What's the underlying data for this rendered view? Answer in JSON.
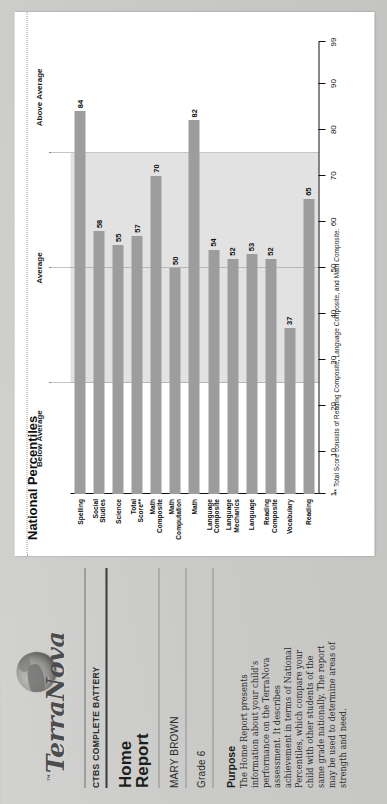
{
  "document": {
    "brand": "TerraNova",
    "brand_tm": "™",
    "battery": "CTBS COMPLETE BATTERY",
    "report_title_line1": "Home",
    "report_title_line2": "Report",
    "student_name": "MARY BROWN",
    "grade": "Grade 6",
    "purpose_heading": "Purpose",
    "purpose_body": "The Home Report presents information about your child's performance on the TerraNova assessment. It describes achievement in terms of National Percentiles, which compare your child with other students of the same grade nationally. The report may be used to determine areas of strength and need."
  },
  "chart_data": {
    "type": "bar",
    "title": "National Percentiles",
    "orientation": "vertical",
    "xlabel": "",
    "ylabel": "",
    "ylim": [
      1,
      99
    ],
    "grid": false,
    "tick_labels": [
      "99",
      "90",
      "80",
      "70",
      "60",
      "50",
      "40",
      "30",
      "20",
      "10",
      "1"
    ],
    "tick_values": [
      99,
      90,
      80,
      70,
      60,
      50,
      40,
      30,
      20,
      10,
      1
    ],
    "bands": [
      {
        "label": "Below Average",
        "from": 1,
        "to": 25
      },
      {
        "label": "Average",
        "from": 25,
        "to": 75
      },
      {
        "label": "Above Average",
        "from": 75,
        "to": 99
      }
    ],
    "band_divider_values": [
      25,
      50,
      75
    ],
    "categories": [
      "Reading",
      "Vocabulary",
      "Reading\nComposite",
      "Language",
      "Language\nMechanics",
      "Language\nComposite",
      "Math",
      "Math\nComputation",
      "Math\nComposite",
      "Total\nScore**",
      "Science",
      "Social\nStudies",
      "Spelling"
    ],
    "values": [
      65,
      37,
      52,
      53,
      52,
      54,
      82,
      50,
      70,
      57,
      55,
      58,
      84
    ],
    "bar_color": "#9d9d9d",
    "band_color": "#e2e2e2",
    "footnote": "** Total Score consists of Reading Composite, Language Composite, and Math Composite."
  }
}
